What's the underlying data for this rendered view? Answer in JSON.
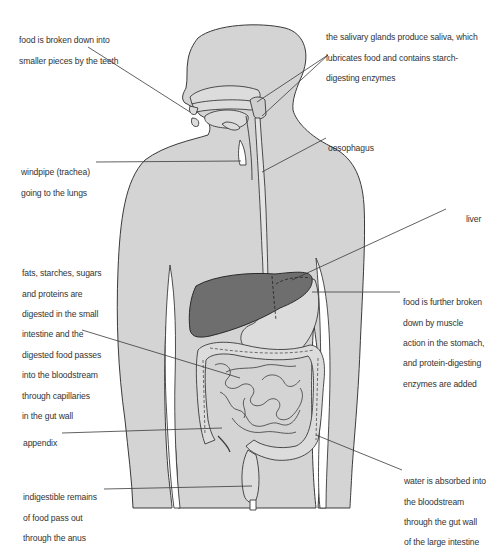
{
  "diagram": {
    "colors": {
      "body_fill": "#d4d4d4",
      "outline": "#3a3a3a",
      "liver_fill": "#6e6e6e",
      "organ_fill": "#dcdcdc",
      "leader_line": "#3a3a3a",
      "background": "#ffffff"
    },
    "labels": {
      "teeth": [
        "food is broken down into",
        "smaller pieces by the teeth"
      ],
      "salivary": [
        "the salivary glands produce saliva, which",
        "lubricates food and contains starch-",
        "digesting enzymes"
      ],
      "oesophagus": [
        "oesophagus"
      ],
      "windpipe": [
        "windpipe (trachea)",
        "going to the lungs"
      ],
      "liver": [
        "liver"
      ],
      "small_intestine": [
        "fats, starches, sugars",
        "and proteins are",
        "digested in the small",
        "intestine and the",
        "digested food passes",
        "into the bloodstream",
        "through capillaries",
        "in the gut wall"
      ],
      "stomach": [
        "food is further broken",
        "down by muscle",
        "action in the stomach,",
        "and protein-digesting",
        "enzymes are added"
      ],
      "appendix": [
        "appendix"
      ],
      "anus": [
        "indigestible remains",
        "of food pass out",
        "through the anus"
      ],
      "large_intestine": [
        "water is absorbed into",
        "the bloodstream",
        "through the gut wall",
        "of the large intestine"
      ]
    }
  }
}
